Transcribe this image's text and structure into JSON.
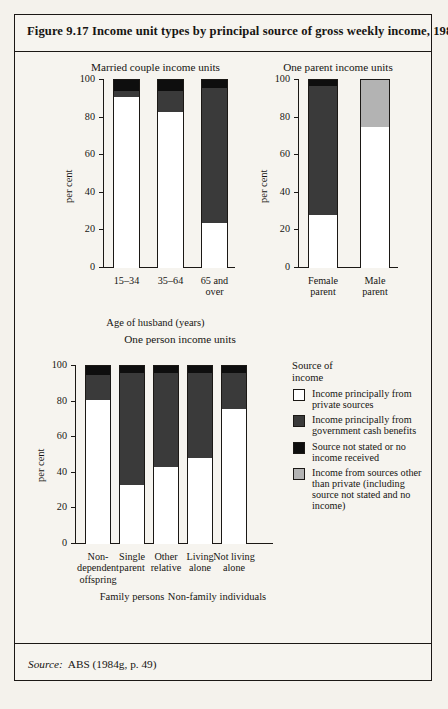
{
  "figure": {
    "title": "Figure 9.17  Income unit types by principal source of gross weekly income, 1982",
    "source_label": "Source:",
    "source_value": "ABS (1984g, p. 49)"
  },
  "legend": {
    "title_line1": "Source of",
    "title_line2": "income",
    "items": [
      {
        "key": "private",
        "label": "Income principally from private sources",
        "color": "#ffffff"
      },
      {
        "key": "govt",
        "label": "Income principally from government cash benefits",
        "color": "#3a3a3a"
      },
      {
        "key": "notstated",
        "label": "Source not stated or no income received",
        "color": "#0e0e0e"
      },
      {
        "key": "other",
        "label": "Income from sources other than private (including source not stated and no income)",
        "color": "#b3b3b3"
      }
    ]
  },
  "axis": {
    "ylabel": "per cent",
    "yticks": [
      "0",
      "20",
      "40",
      "60",
      "80",
      "100"
    ],
    "ymin": 0,
    "ymax": 100
  },
  "chart_data": [
    {
      "type": "bar",
      "stacked": true,
      "title": "Married couple income units",
      "xlabel": "Age of husband (years)",
      "ylabel": "per cent",
      "ylim": [
        0,
        100
      ],
      "yticks": [
        0,
        20,
        40,
        60,
        80,
        100
      ],
      "grid": false,
      "categories": [
        "15–34",
        "35–64",
        "65 and over"
      ],
      "category_lines": [
        [
          "15–34"
        ],
        [
          "35–64"
        ],
        [
          "65 and",
          "over"
        ]
      ],
      "series": [
        {
          "name": "Income principally from private sources",
          "key": "private",
          "color": "#ffffff",
          "values": [
            91,
            83,
            24
          ]
        },
        {
          "name": "Income principally from government cash benefits",
          "key": "govt",
          "color": "#3a3a3a",
          "values": [
            3,
            11,
            72
          ]
        },
        {
          "name": "Source not stated or no income received",
          "key": "notstated",
          "color": "#0e0e0e",
          "values": [
            6,
            6,
            4
          ]
        }
      ]
    },
    {
      "type": "bar",
      "stacked": true,
      "title": "One parent income units",
      "xlabel": "",
      "ylabel": "per cent",
      "ylim": [
        0,
        100
      ],
      "yticks": [
        0,
        20,
        40,
        60,
        80,
        100
      ],
      "grid": false,
      "categories": [
        "Female parent",
        "Male parent"
      ],
      "category_lines": [
        [
          "Female",
          "parent"
        ],
        [
          "Male",
          "parent"
        ]
      ],
      "series": [
        {
          "name": "Income principally from private sources",
          "key": "private",
          "color": "#ffffff",
          "values": [
            28,
            75
          ]
        },
        {
          "name": "Income principally from government cash benefits",
          "key": "govt",
          "color": "#3a3a3a",
          "values": [
            69,
            0
          ]
        },
        {
          "name": "Source not stated or no income received",
          "key": "notstated",
          "color": "#0e0e0e",
          "values": [
            3,
            0
          ]
        },
        {
          "name": "Income from sources other than private (including source not stated and no income)",
          "key": "other",
          "color": "#b3b3b3",
          "values": [
            0,
            25
          ]
        }
      ]
    },
    {
      "type": "bar",
      "stacked": true,
      "title": "One person income units",
      "xlabel": "",
      "ylabel": "per cent",
      "ylim": [
        0,
        100
      ],
      "yticks": [
        0,
        20,
        40,
        60,
        80,
        100
      ],
      "grid": false,
      "categories": [
        "Non-dependent offspring",
        "Single parent",
        "Other relative",
        "Living alone",
        "Not living alone"
      ],
      "category_lines": [
        [
          "Non-",
          "dependent",
          "offspring"
        ],
        [
          "Single",
          "parent"
        ],
        [
          "Other",
          "relative"
        ],
        [
          "Living",
          "alone"
        ],
        [
          "Not living",
          "alone"
        ]
      ],
      "groups": [
        {
          "label": "Family persons",
          "members": [
            0,
            1,
            2
          ]
        },
        {
          "label": "Non-family individuals",
          "members": [
            3,
            4
          ]
        }
      ],
      "series": [
        {
          "name": "Income principally from private sources",
          "key": "private",
          "color": "#ffffff",
          "values": [
            81,
            33,
            43,
            48.5,
            76
          ]
        },
        {
          "name": "Income principally from government cash benefits",
          "key": "govt",
          "color": "#3a3a3a",
          "values": [
            14,
            63,
            53,
            47.5,
            20
          ]
        },
        {
          "name": "Source not stated or no income received",
          "key": "notstated",
          "color": "#0e0e0e",
          "values": [
            5,
            4,
            4,
            4,
            4
          ]
        }
      ]
    }
  ]
}
